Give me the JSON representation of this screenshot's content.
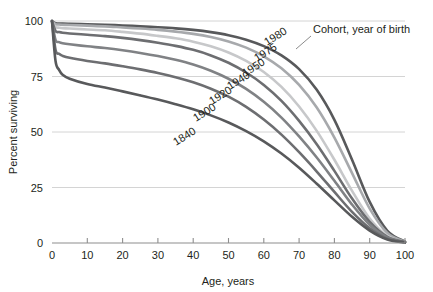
{
  "chart_data": {
    "type": "line",
    "title": "",
    "xlabel": "Age, years",
    "ylabel": "Percent surviving",
    "xlim": [
      0,
      100
    ],
    "ylim": [
      0,
      100
    ],
    "grid": true,
    "legend_position": "inline-curve-labels",
    "annotation": "Cohort, year of birth",
    "xticks": [
      0,
      10,
      20,
      30,
      40,
      50,
      60,
      70,
      80,
      90,
      100
    ],
    "xtick_labels": [
      "0",
      "10",
      "20",
      "30",
      "40",
      "50",
      "60",
      "70",
      "80",
      "90",
      "100"
    ],
    "yticks": [
      0,
      25,
      50,
      75,
      100
    ],
    "ytick_labels": [
      "0",
      "25",
      "50",
      "75",
      "100"
    ],
    "x": [
      0,
      1,
      2,
      3,
      5,
      10,
      15,
      20,
      25,
      30,
      35,
      40,
      45,
      50,
      55,
      60,
      65,
      70,
      75,
      80,
      85,
      90,
      95,
      100
    ],
    "series": [
      {
        "name": "1980",
        "label": "1980",
        "color": "#58595b",
        "values": [
          100,
          99,
          98.9,
          98.8,
          98.7,
          98.5,
          98.3,
          98.0,
          97.6,
          97.2,
          96.7,
          96.0,
          95.0,
          93.6,
          91.6,
          88.7,
          84.5,
          78.3,
          69.0,
          55.5,
          37.5,
          18.5,
          5.5,
          0.6
        ]
      },
      {
        "name": "1975",
        "label": "1975",
        "color": "#a7a9ac",
        "values": [
          100,
          98.6,
          98.4,
          98.3,
          98.2,
          97.9,
          97.6,
          97.1,
          96.6,
          96.0,
          95.2,
          94.2,
          92.8,
          90.8,
          88.0,
          84.1,
          78.7,
          71.2,
          61.0,
          47.5,
          31.5,
          15.5,
          4.5,
          0.5
        ]
      },
      {
        "name": "1950",
        "label": "1950",
        "color": "#c7c8ca",
        "values": [
          100,
          97.3,
          97.0,
          96.8,
          96.6,
          96.2,
          95.8,
          95.1,
          94.3,
          93.3,
          92.2,
          90.7,
          88.6,
          85.8,
          82.0,
          77.0,
          70.3,
          61.5,
          50.5,
          37.5,
          23.5,
          11.0,
          3.2,
          0.4
        ]
      },
      {
        "name": "1940",
        "label": "1940",
        "color": "#6d6e71",
        "values": [
          100,
          95.5,
          95.0,
          94.7,
          94.4,
          93.8,
          93.2,
          92.4,
          91.4,
          90.2,
          88.8,
          87.0,
          84.5,
          81.2,
          76.8,
          71.2,
          64.0,
          55.0,
          44.5,
          32.5,
          20.0,
          9.5,
          2.8,
          0.4
        ]
      },
      {
        "name": "1920",
        "label": "1920",
        "color": "#808285",
        "values": [
          100,
          91.5,
          90.5,
          90.0,
          89.5,
          88.6,
          87.8,
          86.8,
          85.6,
          84.2,
          82.5,
          80.4,
          77.6,
          74.0,
          69.4,
          63.6,
          56.5,
          48.0,
          38.5,
          28.0,
          17.3,
          8.2,
          2.4,
          0.3
        ]
      },
      {
        "name": "1900",
        "label": "1900",
        "color": "#6d6e71",
        "values": [
          100,
          87.0,
          85.2,
          84.3,
          83.4,
          82.0,
          80.9,
          79.6,
          78.2,
          76.6,
          74.7,
          72.4,
          69.5,
          65.9,
          61.3,
          55.6,
          48.8,
          40.9,
          32.2,
          23.0,
          14.0,
          6.6,
          1.9,
          0.3
        ]
      },
      {
        "name": "1840",
        "label": "1840",
        "color": "#58595b",
        "values": [
          100,
          82.0,
          78.0,
          75.8,
          74.0,
          71.6,
          70.0,
          68.3,
          66.5,
          64.6,
          62.5,
          60.2,
          57.5,
          54.3,
          50.4,
          45.8,
          40.3,
          33.9,
          26.7,
          19.2,
          11.8,
          5.6,
          1.6,
          0.2
        ]
      }
    ],
    "curve_label_positions": [
      {
        "name": "1980",
        "x": 267,
        "y": 46,
        "rotate": -32
      },
      {
        "name": "1975",
        "x": 257,
        "y": 62,
        "rotate": -32
      },
      {
        "name": "1950",
        "x": 245,
        "y": 77,
        "rotate": -32
      },
      {
        "name": "1940",
        "x": 230,
        "y": 90,
        "rotate": -32
      },
      {
        "name": "1920",
        "x": 212,
        "y": 105,
        "rotate": -32
      },
      {
        "name": "1900",
        "x": 196,
        "y": 122,
        "rotate": -32
      },
      {
        "name": "1840",
        "x": 176,
        "y": 146,
        "rotate": -32
      }
    ]
  }
}
